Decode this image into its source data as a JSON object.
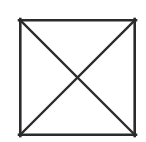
{
  "figure": {
    "canvas": {
      "width": 146,
      "height": 142,
      "background_color": "#ffffff"
    },
    "style": {
      "line_color": "#2b2b2b",
      "outline_stroke_width": 2.6,
      "diagonal_stroke_width": 2.4,
      "fill": "none"
    },
    "square": {
      "name": "outer-square",
      "left": 19,
      "top": 19,
      "right": 136,
      "bottom": 136,
      "width": 117,
      "height": 117
    },
    "vertices": {
      "top_left": [
        19,
        19
      ],
      "top_right": [
        136,
        19
      ],
      "bottom_right": [
        136,
        136
      ],
      "bottom_left": [
        19,
        136
      ],
      "center": [
        77.5,
        77.5
      ]
    },
    "diagonals": [
      {
        "name": "diagonal-top-left-to-bottom-right",
        "from": [
          19,
          19
        ],
        "to": [
          136,
          136
        ]
      },
      {
        "name": "diagonal-top-right-to-bottom-left",
        "from": [
          136,
          19
        ],
        "to": [
          19,
          136
        ]
      }
    ],
    "edges": [
      {
        "name": "edge-top",
        "from": [
          19,
          19
        ],
        "to": [
          136,
          19
        ]
      },
      {
        "name": "edge-right",
        "from": [
          136,
          19
        ],
        "to": [
          136,
          136
        ]
      },
      {
        "name": "edge-bottom",
        "from": [
          136,
          136
        ],
        "to": [
          19,
          136
        ]
      },
      {
        "name": "edge-left",
        "from": [
          19,
          136
        ],
        "to": [
          19,
          19
        ]
      }
    ],
    "regions": [
      {
        "name": "triangle-top",
        "label": ""
      },
      {
        "name": "triangle-right",
        "label": ""
      },
      {
        "name": "triangle-bottom",
        "label": ""
      },
      {
        "name": "triangle-left",
        "label": ""
      }
    ],
    "labels": []
  }
}
